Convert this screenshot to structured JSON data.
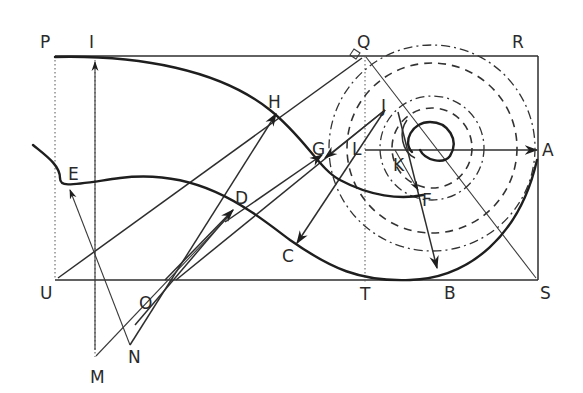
{
  "diagram": {
    "labels": [
      {
        "id": "P",
        "text": "P",
        "x": 40,
        "y": 48
      },
      {
        "id": "I",
        "text": "I",
        "x": 89,
        "y": 48
      },
      {
        "id": "Q",
        "text": "Q",
        "x": 360,
        "y": 48
      },
      {
        "id": "R",
        "text": "R",
        "x": 513,
        "y": 48
      },
      {
        "id": "H",
        "text": "H",
        "x": 270,
        "y": 108
      },
      {
        "id": "J",
        "text": "J",
        "x": 380,
        "y": 108
      },
      {
        "id": "G",
        "text": "G",
        "x": 312,
        "y": 154
      },
      {
        "id": "L",
        "text": "L",
        "x": 352,
        "y": 154
      },
      {
        "id": "K",
        "text": "K",
        "x": 393,
        "y": 170
      },
      {
        "id": "A",
        "text": "A",
        "x": 544,
        "y": 158
      },
      {
        "id": "E",
        "text": "E",
        "x": 68,
        "y": 180
      },
      {
        "id": "F",
        "text": "F",
        "x": 423,
        "y": 205
      },
      {
        "id": "D",
        "text": "D",
        "x": 235,
        "y": 204
      },
      {
        "id": "C",
        "text": "C",
        "x": 282,
        "y": 264
      },
      {
        "id": "U",
        "text": "U",
        "x": 40,
        "y": 298
      },
      {
        "id": "O",
        "text": "O",
        "x": 139,
        "y": 306
      },
      {
        "id": "T",
        "text": "T",
        "x": 360,
        "y": 298
      },
      {
        "id": "B",
        "text": "B",
        "x": 445,
        "y": 298
      },
      {
        "id": "S",
        "text": "S",
        "x": 540,
        "y": 298
      },
      {
        "id": "M",
        "text": "M",
        "x": 91,
        "y": 380
      },
      {
        "id": "N",
        "text": "N",
        "x": 128,
        "y": 360
      }
    ],
    "rectangle": {
      "P": [
        55,
        56
      ],
      "R": [
        538,
        56
      ],
      "S": [
        538,
        280
      ],
      "U": [
        55,
        280
      ]
    },
    "spiral_center": [
      432,
      148
    ],
    "colors": {
      "ink": "#1e1e1e",
      "background": "#ffffff"
    }
  }
}
